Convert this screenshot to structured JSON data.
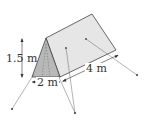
{
  "diagram": {
    "labels": {
      "height": "1.5 m",
      "base": "2 m",
      "length": "4 m"
    },
    "colors": {
      "front_face": "#b8b8b8",
      "side_face": "#e6e6e6",
      "outline": "#444444",
      "rope": "#666666"
    }
  }
}
